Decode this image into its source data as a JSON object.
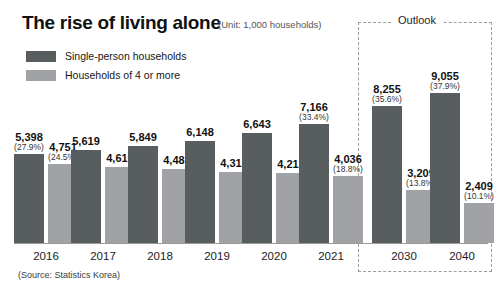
{
  "header": {
    "title": "The rise of living alone",
    "unit": "(Unit: 1,000 households)"
  },
  "legend": {
    "items": [
      {
        "label": "Single-person households",
        "color": "#585d60",
        "icon": "legend-swatch-dark"
      },
      {
        "label": "Households of 4 or more",
        "color": "#a0a2a5",
        "icon": "legend-swatch-light"
      }
    ]
  },
  "outlook": {
    "label": "Outlook"
  },
  "source": "(Source: Statistics Korea)",
  "chart_data": {
    "type": "bar",
    "title": "The rise of living alone",
    "subtitle": "(Unit: 1,000 households)",
    "xlabel": "",
    "ylabel": "",
    "unit": "1,000 households",
    "grid": false,
    "legend_position": "top-left",
    "ylim": [
      0,
      10000
    ],
    "source": "(Source: Statistics Korea)",
    "categories": [
      "2016",
      "2017",
      "2018",
      "2019",
      "2020",
      "2021",
      "2030",
      "2040"
    ],
    "forecast_categories": [
      "2030",
      "2040"
    ],
    "series": [
      {
        "name": "Single-person households",
        "color": "#585d60",
        "values": [
          5398,
          5619,
          5849,
          6148,
          6643,
          7166,
          8255,
          9055
        ],
        "value_labels": [
          "5,398",
          "5,619",
          "5,849",
          "6,148",
          "6,643",
          "7,166",
          "8,255",
          "9,055"
        ],
        "share_labels": [
          "(27.9%)",
          "",
          "",
          "",
          "",
          "(33.4%)",
          "(35.6%)",
          "(37.9%)"
        ],
        "shares": [
          27.9,
          null,
          null,
          null,
          null,
          33.4,
          35.6,
          37.9
        ]
      },
      {
        "name": "Households of 4 or more",
        "color": "#a0a2a5",
        "values": [
          4751,
          4616,
          4481,
          4315,
          4218,
          4036,
          3209,
          2409
        ],
        "value_labels": [
          "4,751",
          "4,616",
          "4,481",
          "4,315",
          "4,218",
          "4,036",
          "3,209",
          "2,409"
        ],
        "share_labels": [
          "(24.5%)",
          "",
          "",
          "",
          "",
          "(18.8%)",
          "(13.8%)",
          "(10.1%)"
        ],
        "shares": [
          24.5,
          null,
          null,
          null,
          null,
          18.8,
          13.8,
          10.1
        ]
      }
    ],
    "annotations": [
      {
        "text": "Outlook",
        "covers": [
          "2030",
          "2040"
        ]
      }
    ]
  }
}
